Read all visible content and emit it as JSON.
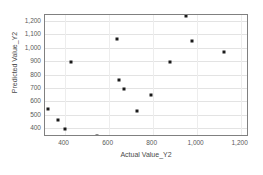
{
  "chart_data": {
    "type": "scatter",
    "title": "",
    "xlabel": "Actual Value_Y2",
    "ylabel": "Predicted Value_Y2",
    "xlim": [
      311,
      1238
    ],
    "ylim": [
      333,
      1245
    ],
    "xticks": [
      400,
      600,
      800,
      1000,
      1200
    ],
    "xticklabels": [
      "400",
      "600",
      "800",
      "1,000",
      "1,200"
    ],
    "yticks": [
      400,
      500,
      600,
      700,
      800,
      900,
      1000,
      1100,
      1200
    ],
    "yticklabels": [
      "400",
      "500",
      "600",
      "700",
      "800",
      "900",
      "1,000",
      "1,100",
      "1,200"
    ],
    "grid": true,
    "legend": false,
    "marker_color": "#1a1a1a",
    "gridline_color": "#e3e3e3",
    "frame_color": "#808080",
    "tick_label_color": "#5a5a5a",
    "points": [
      {
        "x": 325,
        "y": 545
      },
      {
        "x": 370,
        "y": 462
      },
      {
        "x": 402,
        "y": 396
      },
      {
        "x": 428,
        "y": 896
      },
      {
        "x": 548,
        "y": 340
      },
      {
        "x": 640,
        "y": 1065
      },
      {
        "x": 648,
        "y": 762
      },
      {
        "x": 672,
        "y": 692
      },
      {
        "x": 730,
        "y": 528
      },
      {
        "x": 792,
        "y": 648
      },
      {
        "x": 878,
        "y": 893
      },
      {
        "x": 952,
        "y": 1238
      },
      {
        "x": 978,
        "y": 1050
      },
      {
        "x": 1125,
        "y": 968
      }
    ]
  }
}
